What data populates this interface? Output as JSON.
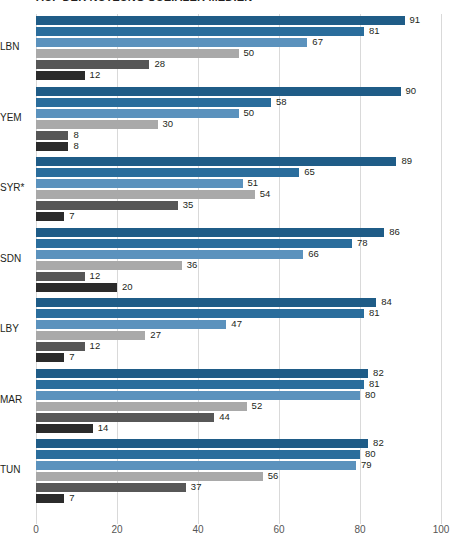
{
  "chart_data": {
    "type": "bar",
    "orientation": "horizontal",
    "title": "AUF DER NUTZUNG SOZIALER MEDIEN",
    "xlabel": "",
    "ylabel": "",
    "xlim": [
      0,
      100
    ],
    "xticks": [
      0,
      20,
      40,
      60,
      80,
      100
    ],
    "xtick_labels": [
      "0",
      "20",
      "40",
      "60",
      "80",
      "100"
    ],
    "grid": true,
    "legend": "none",
    "categories": [
      "LBN",
      "YEM",
      "SYR*",
      "SDN",
      "LBY",
      "MAR",
      "TUN"
    ],
    "series": [
      {
        "name": "series-1",
        "color": "#1f5c87",
        "values": [
          91,
          90,
          89,
          86,
          84,
          82,
          82
        ]
      },
      {
        "name": "series-2",
        "color": "#2a6d9c",
        "values": [
          81,
          58,
          65,
          78,
          81,
          81,
          80
        ]
      },
      {
        "name": "series-3",
        "color": "#5b92bd",
        "values": [
          67,
          50,
          51,
          66,
          47,
          80,
          79
        ]
      },
      {
        "name": "series-4",
        "color": "#a9a9a9",
        "values": [
          50,
          30,
          54,
          36,
          27,
          52,
          56
        ]
      },
      {
        "name": "series-5",
        "color": "#575757",
        "values": [
          28,
          8,
          35,
          12,
          12,
          44,
          37
        ]
      },
      {
        "name": "series-6",
        "color": "#2b2b2b",
        "values": [
          12,
          8,
          7,
          20,
          7,
          14,
          7
        ]
      }
    ],
    "groups": [
      {
        "category": "LBN",
        "bars": [
          {
            "value": 91,
            "label": "91",
            "color": "#1f5c87"
          },
          {
            "value": 81,
            "label": "81",
            "color": "#2a6d9c"
          },
          {
            "value": 67,
            "label": "67",
            "color": "#5b92bd"
          },
          {
            "value": 50,
            "label": "50",
            "color": "#a9a9a9"
          },
          {
            "value": 28,
            "label": "28",
            "color": "#575757"
          },
          {
            "value": 12,
            "label": "12",
            "color": "#2b2b2b"
          }
        ]
      },
      {
        "category": "YEM",
        "bars": [
          {
            "value": 90,
            "label": "90",
            "color": "#1f5c87"
          },
          {
            "value": 58,
            "label": "58",
            "color": "#2a6d9c"
          },
          {
            "value": 50,
            "label": "50",
            "color": "#5b92bd"
          },
          {
            "value": 30,
            "label": "30",
            "color": "#a9a9a9"
          },
          {
            "value": 8,
            "label": "8",
            "color": "#575757"
          },
          {
            "value": 8,
            "label": "8",
            "color": "#2b2b2b"
          }
        ]
      },
      {
        "category": "SYR*",
        "bars": [
          {
            "value": 89,
            "label": "89",
            "color": "#1f5c87"
          },
          {
            "value": 65,
            "label": "65",
            "color": "#2a6d9c"
          },
          {
            "value": 51,
            "label": "51",
            "color": "#5b92bd"
          },
          {
            "value": 54,
            "label": "54",
            "color": "#a9a9a9"
          },
          {
            "value": 35,
            "label": "35",
            "color": "#575757"
          },
          {
            "value": 7,
            "label": "7",
            "color": "#2b2b2b"
          }
        ]
      },
      {
        "category": "SDN",
        "bars": [
          {
            "value": 86,
            "label": "86",
            "color": "#1f5c87"
          },
          {
            "value": 78,
            "label": "78",
            "color": "#2a6d9c"
          },
          {
            "value": 66,
            "label": "66",
            "color": "#5b92bd"
          },
          {
            "value": 36,
            "label": "36",
            "color": "#a9a9a9"
          },
          {
            "value": 12,
            "label": "12",
            "color": "#575757"
          },
          {
            "value": 20,
            "label": "20",
            "color": "#2b2b2b"
          }
        ]
      },
      {
        "category": "LBY",
        "bars": [
          {
            "value": 84,
            "label": "84",
            "color": "#1f5c87"
          },
          {
            "value": 81,
            "label": "81",
            "color": "#2a6d9c"
          },
          {
            "value": 47,
            "label": "47",
            "color": "#5b92bd"
          },
          {
            "value": 27,
            "label": "27",
            "color": "#a9a9a9"
          },
          {
            "value": 12,
            "label": "12",
            "color": "#575757"
          },
          {
            "value": 7,
            "label": "7",
            "color": "#2b2b2b"
          }
        ]
      },
      {
        "category": "MAR",
        "bars": [
          {
            "value": 82,
            "label": "82",
            "color": "#1f5c87"
          },
          {
            "value": 81,
            "label": "81",
            "color": "#2a6d9c"
          },
          {
            "value": 80,
            "label": "80",
            "color": "#5b92bd"
          },
          {
            "value": 52,
            "label": "52",
            "color": "#a9a9a9"
          },
          {
            "value": 44,
            "label": "44",
            "color": "#575757"
          },
          {
            "value": 14,
            "label": "14",
            "color": "#2b2b2b"
          }
        ]
      },
      {
        "category": "TUN",
        "bars": [
          {
            "value": 82,
            "label": "82",
            "color": "#1f5c87"
          },
          {
            "value": 80,
            "label": "80",
            "color": "#2a6d9c"
          },
          {
            "value": 79,
            "label": "79",
            "color": "#5b92bd"
          },
          {
            "value": 56,
            "label": "56",
            "color": "#a9a9a9"
          },
          {
            "value": 37,
            "label": "37",
            "color": "#575757"
          },
          {
            "value": 7,
            "label": "7",
            "color": "#2b2b2b"
          }
        ]
      }
    ]
  }
}
